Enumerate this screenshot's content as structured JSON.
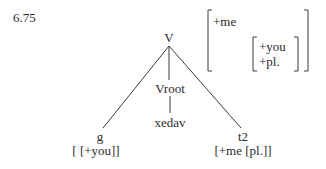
{
  "example_number": "6.75",
  "tree": {
    "root": "V",
    "children": [
      {
        "label": "g",
        "features": "[ [+you]]"
      },
      {
        "label": "Vroot",
        "child": "xedav"
      },
      {
        "label": "t2",
        "features": "[+me [pl.]]"
      }
    ]
  },
  "feature_matrix": {
    "outer": [
      "+me"
    ],
    "inner": [
      "+you",
      "+pl."
    ]
  },
  "colors": {
    "ink": "#2a2a2a",
    "background": "#ffffff"
  }
}
